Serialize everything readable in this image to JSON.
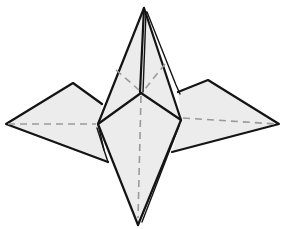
{
  "figure": {
    "colors": {
      "paper_fill": "#ececec",
      "outline": "#141414",
      "crease_dashed": "#9a9a9a",
      "background": "#ffffff"
    },
    "parts": [
      {
        "name": "top-point"
      },
      {
        "name": "left-wing"
      },
      {
        "name": "right-wing"
      },
      {
        "name": "bottom-point"
      }
    ],
    "line_types": [
      {
        "name": "fold-edge",
        "style": "solid"
      },
      {
        "name": "valley-crease",
        "style": "dashed"
      }
    ]
  }
}
